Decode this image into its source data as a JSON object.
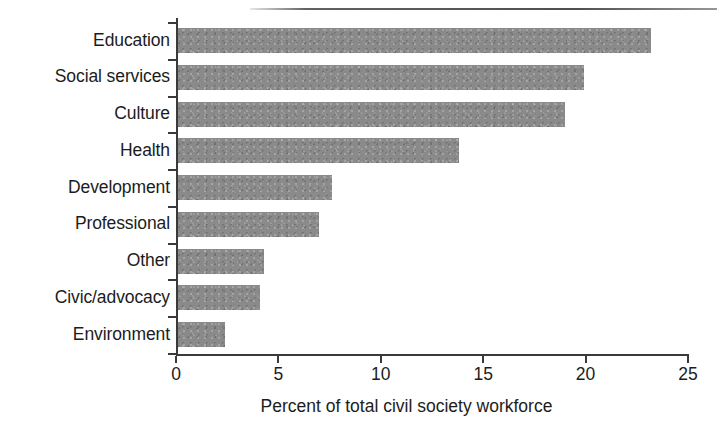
{
  "chart_data": {
    "type": "bar",
    "orientation": "horizontal",
    "title": "",
    "xlabel": "Percent of total civil society workforce",
    "ylabel": "",
    "xlim": [
      0,
      25
    ],
    "xticks": [
      0,
      5,
      10,
      15,
      20,
      25
    ],
    "xtick_labels": [
      "0",
      "5",
      "10",
      "15",
      "20",
      "25"
    ],
    "grid": false,
    "legend": null,
    "bar_color": "#8a8a8a",
    "axis_color": "#3a3a3a",
    "text_color": "#1c1c1c",
    "categories": [
      "Education",
      "Social services",
      "Culture",
      "Health",
      "Development",
      "Professional",
      "Other",
      "Civic/advocacy",
      "Environment"
    ],
    "values": [
      23.2,
      19.9,
      19.0,
      13.8,
      7.6,
      7.0,
      4.3,
      4.1,
      2.4
    ]
  }
}
